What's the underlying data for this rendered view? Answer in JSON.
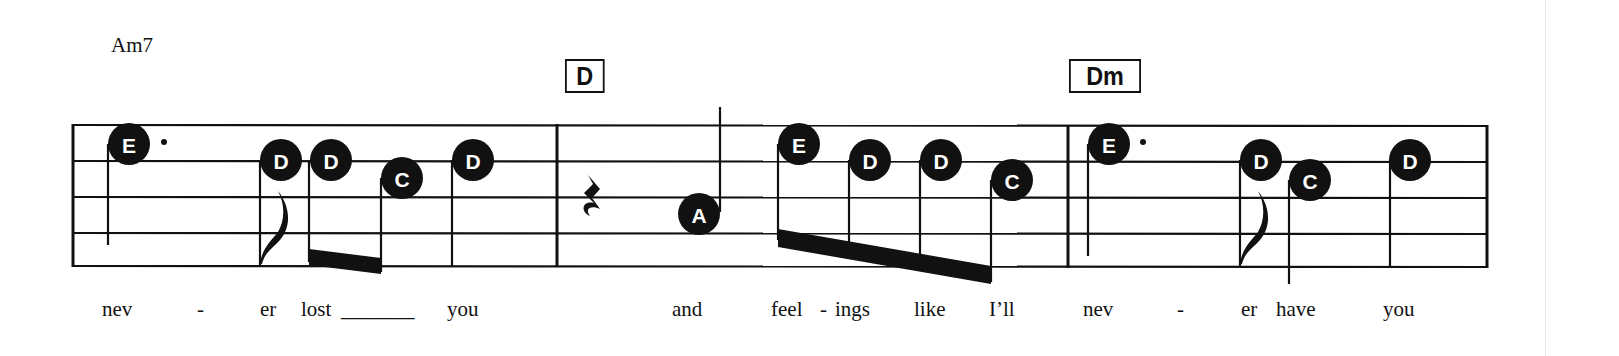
{
  "sheet": {
    "chords": [
      {
        "label": "Am7",
        "style": "plain"
      },
      {
        "label": "D",
        "style": "boxed"
      },
      {
        "label": "Dm",
        "style": "boxed"
      }
    ],
    "notes": [
      {
        "name": "E",
        "duration": "dotted-quarter"
      },
      {
        "name": "D",
        "duration": "eighth"
      },
      {
        "name": "D",
        "duration": "eighth"
      },
      {
        "name": "C",
        "duration": "eighth"
      },
      {
        "name": "D",
        "duration": "quarter"
      },
      {
        "name": "A",
        "duration": "quarter"
      },
      {
        "name": "E",
        "duration": "eighth"
      },
      {
        "name": "D",
        "duration": "eighth"
      },
      {
        "name": "D",
        "duration": "eighth"
      },
      {
        "name": "C",
        "duration": "eighth"
      },
      {
        "name": "E",
        "duration": "dotted-quarter"
      },
      {
        "name": "D",
        "duration": "eighth"
      },
      {
        "name": "C",
        "duration": "quarter"
      },
      {
        "name": "D",
        "duration": "quarter"
      }
    ],
    "rest": "quarter-rest",
    "lyrics": [
      "nev",
      "-",
      "er",
      "lost",
      "_______",
      "you",
      "and",
      "feel",
      "-",
      "ings",
      "like",
      "I’ll",
      "nev",
      "-",
      "er",
      "have",
      "you"
    ]
  }
}
